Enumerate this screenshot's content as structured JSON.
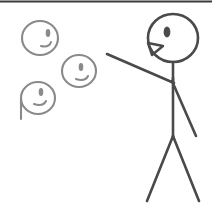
{
  "scene": {
    "title": "Stick figure facing three floating heads",
    "alt_text": "A line drawing of a large stick figure on the right with one arm raised toward three smaller floating heads on the left",
    "canvas": {
      "width": 212,
      "height": 209,
      "background": "#ffffff"
    },
    "top_rule": {
      "color": "#3a3a3a",
      "thickness": 2
    },
    "colors": {
      "figure_stroke": "#4a4a4a",
      "small_head_stroke": "#8a8a8a",
      "border": "#3a3a3a",
      "background": "#ffffff"
    }
  },
  "figure": {
    "label": "stick-figure",
    "stroke_width": 2.6,
    "head": {
      "cx": 173,
      "cy": 38,
      "rx": 25,
      "ry": 24
    },
    "eye": {
      "cx": 167,
      "cy": 32,
      "rx": 3.4,
      "ry": 5.4
    },
    "mouth_path": "M 148 43 L 163 46 L 152 55 Z",
    "neck": {
      "x1": 173,
      "y1": 62,
      "x2": 173,
      "y2": 82
    },
    "spine": {
      "x1": 173,
      "y1": 78,
      "x2": 173,
      "y2": 139
    },
    "arm_raised": {
      "x1": 107,
      "y1": 54,
      "x2": 174,
      "y2": 83
    },
    "arm_lowered": {
      "x1": 172,
      "y1": 81,
      "x2": 196,
      "y2": 136
    },
    "leg_left": {
      "x1": 173,
      "y1": 136,
      "x2": 147,
      "y2": 201
    },
    "leg_right": {
      "x1": 173,
      "y1": 136,
      "x2": 199,
      "y2": 201
    }
  },
  "floating_heads": [
    {
      "name": "floating-head-top-left",
      "cx": 40,
      "cy": 38,
      "rx": 18,
      "ry": 17,
      "eye": {
        "cx": 48,
        "cy": 33,
        "rx": 2.3,
        "ry": 4.0
      },
      "mouth_path": "M 41 46 Q 49 48 51 42",
      "tail": null
    },
    {
      "name": "floating-head-middle",
      "cx": 79,
      "cy": 71,
      "rx": 17,
      "ry": 16,
      "eye": {
        "cx": 81,
        "cy": 67,
        "rx": 2.3,
        "ry": 4.0
      },
      "mouth_path": "M 76 79 Q 85 82 88 76",
      "tail": null
    },
    {
      "name": "floating-head-bottom-left",
      "cx": 38,
      "cy": 98,
      "rx": 17,
      "ry": 16,
      "eye": {
        "cx": 41,
        "cy": 92,
        "rx": 2.3,
        "ry": 4.0
      },
      "mouth_path": "M 34 104 Q 43 107 46 101",
      "tail": {
        "x1": 21,
        "y1": 98,
        "x2": 21,
        "y2": 119
      }
    }
  ]
}
